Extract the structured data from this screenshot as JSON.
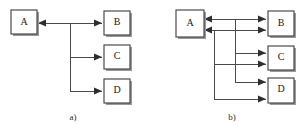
{
  "figure": {
    "background_color": "#ffffff",
    "line_color": "#4a4a4a",
    "box_border_color": "#3b3b3b",
    "box_fill_color": "#ffffff",
    "arrow_color": "#2e2e2e",
    "text_color": "#1a1a1a"
  },
  "panels": [
    {
      "id": "panel-a",
      "caption": "a)",
      "nodes": [
        {
          "id": "a-node-a",
          "label": "A"
        },
        {
          "id": "a-node-b",
          "label": "B"
        },
        {
          "id": "a-node-c",
          "label": "C"
        },
        {
          "id": "a-node-d",
          "label": "D"
        }
      ],
      "edges": [
        {
          "from": "A",
          "to": "B",
          "direction": "both"
        },
        {
          "from": "A",
          "to": "C",
          "direction": "to"
        },
        {
          "from": "A",
          "to": "D",
          "direction": "to"
        }
      ]
    },
    {
      "id": "panel-b",
      "caption": "b)",
      "nodes": [
        {
          "id": "b-node-a",
          "label": "A"
        },
        {
          "id": "b-node-b",
          "label": "B"
        },
        {
          "id": "b-node-c",
          "label": "C"
        },
        {
          "id": "b-node-d",
          "label": "D"
        }
      ],
      "edges": [
        {
          "from": "A",
          "to": "B",
          "direction": "to"
        },
        {
          "from": "B",
          "to": "A",
          "direction": "to"
        },
        {
          "from": "A",
          "to": "C",
          "direction": "to"
        },
        {
          "from": "C",
          "to": "A",
          "direction": "to"
        },
        {
          "from": "A",
          "to": "D",
          "direction": "to"
        },
        {
          "from": "D",
          "to": "A",
          "direction": "to"
        }
      ]
    }
  ]
}
